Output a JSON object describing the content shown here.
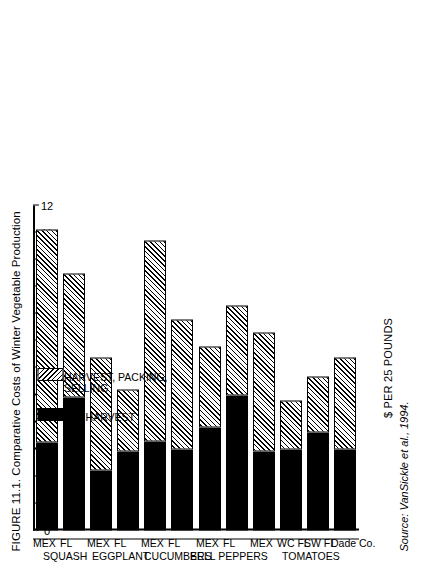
{
  "figure": {
    "title": "FIGURE 11.1. Comparative Costs of Winter Vegetable Production",
    "source_label": "Source:",
    "source_text": " VanSickle et al., 1994."
  },
  "legend": {
    "items": [
      {
        "label": "PREHARVEST",
        "swatch": "solid-black"
      },
      {
        "label": "HARVEST, PACKING,",
        "label2": "SELLING",
        "swatch": "diagonal-hatch"
      }
    ]
  },
  "chart_data": {
    "type": "bar",
    "orientation": "horizontal-rotated",
    "title": "FIGURE 11.1. Comparative Costs of Winter Vegetable Production",
    "xlabel": "",
    "ylabel": "$ PER 25 POUNDS",
    "ylim": [
      0,
      12
    ],
    "yticks": [
      0,
      1,
      2,
      3,
      4,
      5,
      6,
      7,
      8,
      9,
      10,
      11,
      12
    ],
    "ytick_labels": [
      "0",
      "1",
      "2",
      "3",
      "4",
      "5",
      "6",
      "7",
      "8",
      "9",
      "10",
      "11",
      "12"
    ],
    "grid": false,
    "legend_position": "upper-left-inside",
    "stacked": true,
    "categories": [
      "Dade Co.",
      "SW FL",
      "WC FL",
      "MEX",
      "FL",
      "MEX",
      "FL",
      "MEX",
      "FL",
      "MEX",
      "FL",
      "MEX"
    ],
    "groups": [
      {
        "name": "TOMATOES",
        "members": [
          "Dade Co.",
          "SW FL",
          "WC FL",
          "MEX"
        ]
      },
      {
        "name": "BELL PEPPERS",
        "members": [
          "FL",
          "MEX"
        ]
      },
      {
        "name": "CUCUMBERS",
        "members": [
          "FL",
          "MEX"
        ]
      },
      {
        "name": "EGGPLANT",
        "members": [
          "FL",
          "MEX"
        ]
      },
      {
        "name": "SQUASH",
        "members": [
          "FL",
          "MEX"
        ]
      }
    ],
    "series": [
      {
        "name": "PREHARVEST",
        "values": [
          3.0,
          3.6,
          3.0,
          2.9,
          5.0,
          3.8,
          3.0,
          3.3,
          2.9,
          2.2,
          4.9,
          3.25
        ]
      },
      {
        "name": "HARVEST, PACKING, SELLING",
        "values": [
          3.4,
          2.1,
          1.8,
          4.4,
          3.3,
          3.0,
          4.8,
          7.4,
          2.3,
          4.2,
          4.6,
          7.85
        ]
      }
    ],
    "bars": [
      {
        "label": "Dade Co.",
        "group": "TOMATOES",
        "preharvest": 3.0,
        "harvest_packing_selling": 3.4,
        "total": 6.4
      },
      {
        "label": "SW FL",
        "group": "TOMATOES",
        "preharvest": 3.6,
        "harvest_packing_selling": 2.1,
        "total": 5.7
      },
      {
        "label": "WC FL",
        "group": "TOMATOES",
        "preharvest": 3.0,
        "harvest_packing_selling": 1.8,
        "total": 4.8
      },
      {
        "label": "MEX",
        "group": "TOMATOES",
        "preharvest": 2.9,
        "harvest_packing_selling": 4.4,
        "total": 7.3
      },
      {
        "label": "FL",
        "group": "BELL PEPPERS",
        "preharvest": 5.0,
        "harvest_packing_selling": 3.3,
        "total": 8.3
      },
      {
        "label": "MEX",
        "group": "BELL PEPPERS",
        "preharvest": 3.8,
        "harvest_packing_selling": 3.0,
        "total": 6.8
      },
      {
        "label": "FL",
        "group": "CUCUMBERS",
        "preharvest": 3.0,
        "harvest_packing_selling": 4.8,
        "total": 7.8
      },
      {
        "label": "MEX",
        "group": "CUCUMBERS",
        "preharvest": 3.3,
        "harvest_packing_selling": 7.4,
        "total": 10.7
      },
      {
        "label": "FL",
        "group": "EGGPLANT",
        "preharvest": 2.9,
        "harvest_packing_selling": 2.3,
        "total": 5.2
      },
      {
        "label": "MEX",
        "group": "EGGPLANT",
        "preharvest": 2.2,
        "harvest_packing_selling": 4.2,
        "total": 6.4
      },
      {
        "label": "FL",
        "group": "SQUASH",
        "preharvest": 4.9,
        "harvest_packing_selling": 4.6,
        "total": 9.5
      },
      {
        "label": "MEX",
        "group": "SQUASH",
        "preharvest": 3.25,
        "harvest_packing_selling": 7.85,
        "total": 11.1
      }
    ],
    "colors": {
      "preharvest": "#000000",
      "harvest_packing_selling": "#ffffff",
      "axis": "#000000",
      "background": "#ffffff"
    }
  }
}
